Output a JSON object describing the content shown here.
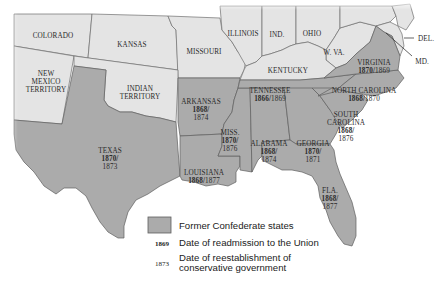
{
  "map": {
    "colors": {
      "union_fill": "#e4e4e4",
      "confederate_fill": "#ababab",
      "border": "#5e5e5e",
      "background": "#ffffff"
    },
    "union_states": [
      {
        "id": "colorado",
        "label": "COLORADO"
      },
      {
        "id": "kansas",
        "label": "KANSAS"
      },
      {
        "id": "missouri",
        "label": "MISSOURI"
      },
      {
        "id": "illinois",
        "label": "ILLINOIS"
      },
      {
        "id": "indiana",
        "label": "IND."
      },
      {
        "id": "ohio",
        "label": "OHIO"
      },
      {
        "id": "west-virginia",
        "label": "W. VA."
      },
      {
        "id": "kentucky",
        "label": "KENTUCKY"
      },
      {
        "id": "new-mexico",
        "label_lines": [
          "NEW",
          "MEXICO",
          "TERRITORY"
        ]
      },
      {
        "id": "indian-territory",
        "label_lines": [
          "INDIAN",
          "TERRITORY"
        ]
      },
      {
        "id": "delaware",
        "label": "DEL."
      },
      {
        "id": "maryland",
        "label": "MD."
      }
    ],
    "confederate_states": [
      {
        "id": "texas",
        "label": "TEXAS",
        "readmission": "1870",
        "conservative": "1873"
      },
      {
        "id": "arkansas",
        "label": "ARKANSAS",
        "readmission": "1868",
        "conservative": "1874"
      },
      {
        "id": "louisiana",
        "label": "LOUISIANA",
        "readmission": "1868",
        "conservative": "1877"
      },
      {
        "id": "mississippi",
        "label": "MISS.",
        "readmission": "1870",
        "conservative": "1876"
      },
      {
        "id": "alabama",
        "label": "ALABAMA",
        "readmission": "1868",
        "conservative": "1874"
      },
      {
        "id": "georgia",
        "label": "GEORGIA",
        "readmission": "1870",
        "conservative": "1871"
      },
      {
        "id": "florida",
        "label": "FLA.",
        "readmission": "1868",
        "conservative": "1877"
      },
      {
        "id": "tennessee",
        "label": "TENNESSEE",
        "readmission": "1866",
        "conservative": "1869"
      },
      {
        "id": "virginia",
        "label": "VIRGINIA",
        "readmission": "1870",
        "conservative": "1869"
      },
      {
        "id": "north-carolina",
        "label": "NORTH CAROLINA",
        "readmission": "1868",
        "conservative": "1870"
      },
      {
        "id": "south-carolina",
        "label_lines": [
          "SOUTH",
          "CAROLINA"
        ],
        "readmission": "1868",
        "conservative": "1876"
      }
    ],
    "separator": "/"
  },
  "legend": {
    "swatch_label": "Former Confederate states",
    "readmission_sample": "1869",
    "readmission_label": "Date of readmission to the Union",
    "conservative_sample": "1873",
    "conservative_label_lines": [
      "Date of reestablishment of",
      "conservative government"
    ]
  }
}
